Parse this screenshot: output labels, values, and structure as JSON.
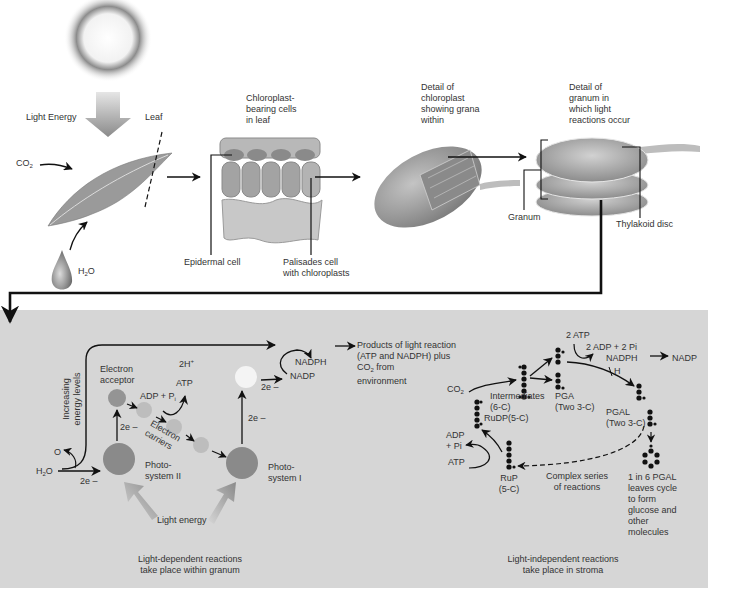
{
  "top": {
    "light_energy": "Light Energy",
    "leaf": "Leaf",
    "co2": "CO",
    "co2_sub": "2",
    "h2o_h": "H",
    "h2o_sub": "2",
    "h2o_o": "O",
    "chloroplast_cells": "Chloroplast-\nbearing cells\nin leaf",
    "epidermal_cell": "Epidermal cell",
    "palisades_cell": "Palisades cell\nwith chloroplasts",
    "detail_chloroplast": "Detail of\nchloroplast\nshowing grana\nwithin",
    "detail_granum": "Detail of\ngranum in\nwhich light\nreactions occur",
    "granum": "Granum",
    "thylakoid_disc": "Thylakoid disc"
  },
  "light_dependent": {
    "energy_axis": "Increasing\nenergy levels",
    "two_h_plus": "2H",
    "two_h_plus_sup": "+",
    "electron_acceptor": "Electron\nacceptor",
    "atp": "ATP",
    "adp_pi": "ADP + P",
    "adp_pi_sub": "i",
    "electron_carriers": "Electron\ncarriers",
    "two_e_1": "2e –",
    "two_e_2": "2e –",
    "two_e_3": "2e –",
    "two_e_4": "2e –",
    "o": "O",
    "h2o": "H",
    "h2o_sub": "2",
    "h2o_o": "O",
    "photosystem_2": "Photo-\nsystem II",
    "photosystem_1": "Photo-\nsystem I",
    "nadph": "NADPH",
    "nadp": "NADP",
    "light_energy": "Light energy",
    "caption": "Light-dependent reactions\ntake place within granum"
  },
  "products": {
    "text_1": "Products of light reaction\n(ATP and NADPH) plus",
    "co2": "CO",
    "co2_sub": "2",
    "text_2": " from\nenvironment"
  },
  "light_independent": {
    "two_atp": "2 ATP",
    "two_adp_pi": "2 ADP + 2 Pi",
    "nadph": "NADPH",
    "nadp": "NADP",
    "h": "H",
    "co2": "CO",
    "co2_sub": "2",
    "intermediates": "Intermediates\n(6-C)",
    "rudp": "RuDP(5-C)",
    "pga": "PGA\n(Two 3-C)",
    "pgal": "PGAL\n(Two 3-C)",
    "adp_pi": "ADP\n+ Pi",
    "atp": "ATP",
    "rup": "RuP\n(5-C)",
    "complex_series": "Complex series\nof reactions",
    "pgal_leaves": "1 in 6 PGAL\nleaves cycle\nto form\nglucose and\nother\nmolecules",
    "caption": "Light-independent reactions\ntake place in stroma"
  },
  "colors": {
    "panel": "#d6d6d6",
    "photosystem": "#8a8a8a",
    "acceptor": "#949494",
    "carrier": "#bdbdbd",
    "ps1_excited": "#f4f4f4",
    "arrow": "#111111"
  }
}
